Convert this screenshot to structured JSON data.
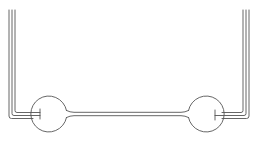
{
  "diagram": {
    "stroke_color": "#555555",
    "background": "#ffffff",
    "bulbs": [
      {
        "name": "left-bulb",
        "cx": 50,
        "cy": 114,
        "r": 18
      },
      {
        "name": "right-bulb",
        "cx": 205,
        "cy": 114,
        "r": 18
      }
    ],
    "connecting_tube": {
      "y_top": 112,
      "y_bottom": 116,
      "x_start": 68,
      "x_end": 187
    },
    "left_vertical_tubes": {
      "x": [
        9,
        12,
        15
      ],
      "y_top": 10
    },
    "right_vertical_tubes": {
      "x": [
        243,
        246,
        249
      ],
      "y_top": 10
    }
  }
}
